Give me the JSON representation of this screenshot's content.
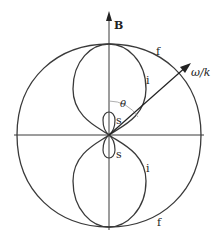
{
  "diagram": {
    "field_label": "B",
    "vector_label": "ω/k",
    "angle_label": "θ",
    "curves": [
      {
        "id": "fast",
        "label": "f"
      },
      {
        "id": "intermediate",
        "label": "i"
      },
      {
        "id": "slow",
        "label": "s"
      }
    ],
    "labels": {
      "f_top": "f",
      "f_bottom": "f",
      "i_top": "i",
      "i_bottom": "i",
      "s_top": "s",
      "s_bottom": "s"
    },
    "colors": {
      "stroke": "#3a3a3a",
      "angle_arc": "#9a9a9a"
    }
  }
}
